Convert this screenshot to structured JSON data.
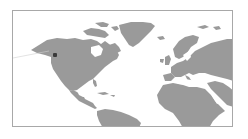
{
  "map": {
    "land_color": "#9a9a9a",
    "ocean_color": "#ffffff",
    "frame_color": "#a8a8a8",
    "regions_visible": [
      "North America",
      "Greenland",
      "Central America",
      "Caribbean",
      "South America (north)",
      "Europe",
      "North Africa",
      "Africa",
      "Middle East",
      "Western Asia"
    ]
  },
  "marker": {
    "icon": "location-marker-icon",
    "color": "#3a3a3a",
    "x": 54,
    "y": 54,
    "location": "Pacific Northwest"
  }
}
